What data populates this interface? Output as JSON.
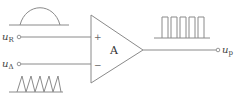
{
  "diagram": {
    "title": "",
    "amplifier": {
      "label": "A",
      "plus": "+",
      "minus": "−"
    },
    "inputs": [
      {
        "name": "u",
        "sub": "R",
        "waveform": "half-sine"
      },
      {
        "name": "u",
        "sub": "Δ",
        "waveform": "triangle"
      }
    ],
    "output": {
      "name": "u",
      "sub": "p",
      "waveform": "pulse-train"
    },
    "colors": {
      "line": "#8a8a8a",
      "text": "#444444"
    }
  }
}
